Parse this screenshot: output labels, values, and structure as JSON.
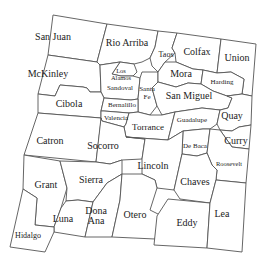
{
  "map": {
    "title": "New Mexico Counties",
    "colors": {
      "background": "#ffffff",
      "border": "#555555",
      "text": "#222222"
    },
    "counties": [
      {
        "name": "San Juan",
        "x": 53,
        "y": 40,
        "size": 10
      },
      {
        "name": "Rio Arriba",
        "x": 127,
        "y": 46,
        "size": 10
      },
      {
        "name": "Taos",
        "x": 166,
        "y": 57,
        "size": 8
      },
      {
        "name": "Colfax",
        "x": 197,
        "y": 55,
        "size": 10
      },
      {
        "name": "Union",
        "x": 237,
        "y": 61,
        "size": 10
      },
      {
        "name": "McKinley",
        "x": 48,
        "y": 77,
        "size": 10
      },
      {
        "name": "Los",
        "x": 121,
        "y": 73,
        "size": 6.5
      },
      {
        "name": "Alamos",
        "x": 121,
        "y": 80,
        "size": 6.5
      },
      {
        "name": "Sandoval",
        "x": 120,
        "y": 90,
        "size": 7
      },
      {
        "name": "Mora",
        "x": 181,
        "y": 77,
        "size": 10
      },
      {
        "name": "Harding",
        "x": 222,
        "y": 84,
        "size": 7
      },
      {
        "name": "Santa",
        "x": 147,
        "y": 91,
        "size": 7
      },
      {
        "name": "Fe",
        "x": 147,
        "y": 99,
        "size": 7
      },
      {
        "name": "San Miguel",
        "x": 189,
        "y": 99,
        "size": 10
      },
      {
        "name": "Cibola",
        "x": 69,
        "y": 107,
        "size": 10
      },
      {
        "name": "Bernalillo",
        "x": 122,
        "y": 104,
        "size": 7
      },
      {
        "name": "Valencia",
        "x": 116,
        "y": 119,
        "size": 7
      },
      {
        "name": "Torrance",
        "x": 146,
        "y": 130,
        "size": 9
      },
      {
        "name": "Guadalupe",
        "x": 192,
        "y": 122,
        "size": 7
      },
      {
        "name": "Quay",
        "x": 229,
        "y": 118,
        "size": 10
      },
      {
        "name": "Catron",
        "x": 40,
        "y": 142,
        "size": 10
      },
      {
        "name": "Socorro",
        "x": 105,
        "y": 149,
        "size": 10
      },
      {
        "name": "De Baca",
        "x": 193,
        "y": 147,
        "size": 7
      },
      {
        "name": "Curry",
        "x": 233,
        "y": 142,
        "size": 10
      },
      {
        "name": "Lincoln",
        "x": 154,
        "y": 167,
        "size": 10
      },
      {
        "name": "Roosevelt",
        "x": 222,
        "y": 164,
        "size": 6.5
      },
      {
        "name": "Grant",
        "x": 40,
        "y": 187,
        "size": 10
      },
      {
        "name": "Sierra",
        "x": 86,
        "y": 182,
        "size": 10
      },
      {
        "name": "Chaves",
        "x": 191,
        "y": 182,
        "size": 10
      },
      {
        "name": "Luna",
        "x": 64,
        "y": 220,
        "size": 10
      },
      {
        "name": "Dona",
        "x": 94,
        "y": 213,
        "size": 10
      },
      {
        "name": "Ana",
        "x": 94,
        "y": 222,
        "size": 10
      },
      {
        "name": "Otero",
        "x": 135,
        "y": 218,
        "size": 10
      },
      {
        "name": "Lea",
        "x": 220,
        "y": 215,
        "size": 10
      },
      {
        "name": "Eddy",
        "x": 185,
        "y": 224,
        "size": 10
      },
      {
        "name": "Hidalgo",
        "x": 27,
        "y": 238,
        "size": 8
      }
    ]
  }
}
